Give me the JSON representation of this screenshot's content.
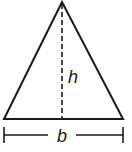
{
  "diagram": {
    "shape": "triangle",
    "labels": {
      "height": "h",
      "base": "b"
    },
    "colors": {
      "stroke": "#1a1a1a",
      "background": "#ffffff"
    }
  }
}
